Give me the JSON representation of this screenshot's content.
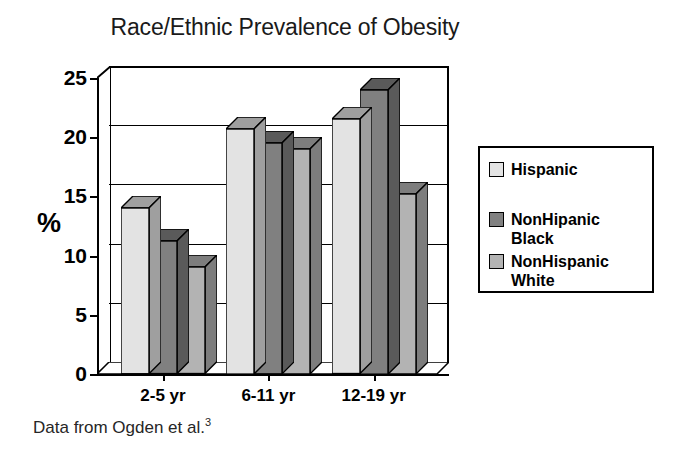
{
  "chart_data": {
    "type": "bar",
    "title": "Race/Ethnic Prevalence of Obesity",
    "xlabel": "",
    "ylabel": "%",
    "ylim": [
      0,
      25
    ],
    "yticks": [
      0,
      5,
      10,
      15,
      20,
      25
    ],
    "ytick_labels": [
      "0",
      "5",
      "10",
      "15",
      "20",
      "25"
    ],
    "categories": [
      "2-5 yr",
      "6-11 yr",
      "12-19 yr"
    ],
    "grid": true,
    "legend_position": "right",
    "style": "3d-clustered-column",
    "series": [
      {
        "name": "Hispanic",
        "color": "#e3e3e3",
        "values": [
          14.0,
          20.7,
          21.5
        ]
      },
      {
        "name": "NonHipanic Black",
        "color": "#808080",
        "values": [
          11.2,
          19.5,
          24.0
        ]
      },
      {
        "name": "NonHispanic White",
        "color": "#b3b3b3",
        "values": [
          9.0,
          19.0,
          15.2
        ]
      }
    ],
    "annotations": [
      "Data from Ogden et al.3"
    ]
  },
  "legend": {
    "entries": [
      {
        "label": "Hispanic",
        "color": "#e3e3e3"
      },
      {
        "label": "NonHipanic\nBlack",
        "color": "#808080"
      },
      {
        "label": "NonHispanic\nWhite",
        "color": "#b3b3b3"
      }
    ]
  },
  "footnote": {
    "text": "Data from Ogden et al.",
    "reference": "3"
  }
}
